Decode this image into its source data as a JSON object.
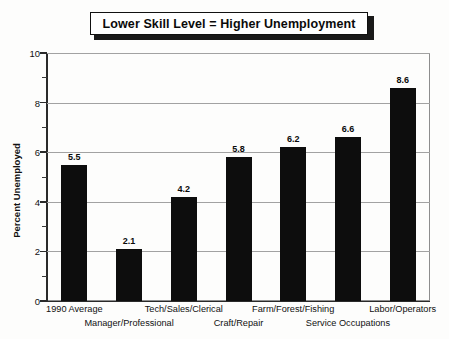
{
  "chart_data": {
    "type": "bar",
    "title": "Lower Skill Level = Higher Unemployment",
    "xlabel": "",
    "ylabel": "Percent Unemployed",
    "ylim": [
      0,
      10
    ],
    "ytick_step": 2,
    "yticks": [
      "0",
      "2",
      "4",
      "6",
      "8",
      "10"
    ],
    "minor_ticks": [
      1,
      3,
      5,
      7,
      9
    ],
    "grid": "horizontal-major",
    "legend": "none",
    "bar_color": "#0d0d0d",
    "categories": [
      "1990 Average",
      "Manager/Professional",
      "Tech/Sales/Clerical",
      "Craft/Repair",
      "Farm/Forest/Fishing",
      "Service Occupations",
      "Labor/Operators"
    ],
    "values": [
      5.5,
      2.1,
      4.2,
      5.8,
      6.2,
      6.6,
      8.6
    ],
    "value_labels": [
      "5.5",
      "2.1",
      "4.2",
      "5.8",
      "6.2",
      "6.6",
      "8.6"
    ]
  }
}
